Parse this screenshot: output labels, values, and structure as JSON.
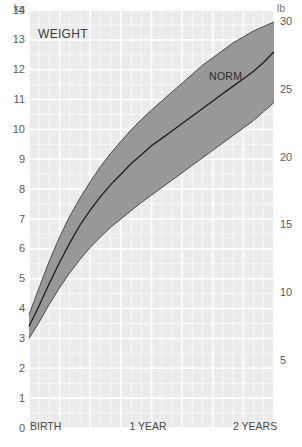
{
  "chart_title": "WEIGHT",
  "axes": {
    "left_unit": "kg",
    "right_unit": "lb",
    "left_ticks": [
      "0",
      "1",
      "2",
      "3",
      "4",
      "5",
      "6",
      "7",
      "8",
      "9",
      "10",
      "11",
      "12",
      "13",
      "14"
    ],
    "right_ticks": [
      "5",
      "10",
      "15",
      "20",
      "25",
      "30"
    ],
    "x_ticks": [
      "BIRTH",
      "1 YEAR",
      "2 YEARS"
    ]
  },
  "annotations": {
    "norm_label": "NORM"
  },
  "colors": {
    "plot_background": "#ebebeb",
    "gridline": "#ffffff",
    "band_fill": "#989898",
    "band_stroke": "#4a4a4a",
    "norm_line": "#1c1c1c",
    "tick_text": "#5a5a5a",
    "page_background": "#ffffff"
  },
  "chart_data": {
    "type": "area",
    "title": "WEIGHT",
    "xlabel": "",
    "ylabel": "kg",
    "xlim": [
      0,
      24
    ],
    "ylim": [
      0,
      14
    ],
    "y2lim": [
      0,
      30.86
    ],
    "y2label": "lb",
    "grid": true,
    "legend_position": "none",
    "x_unit": "months",
    "x_tick_positions": [
      0,
      12,
      24
    ],
    "x_tick_labels": [
      "BIRTH",
      "1 YEAR",
      "2 YEARS"
    ],
    "y_tick_values": [
      0,
      1,
      2,
      3,
      4,
      5,
      6,
      7,
      8,
      9,
      10,
      11,
      12,
      13,
      14
    ],
    "y2_tick_values": [
      5,
      10,
      15,
      20,
      25,
      30
    ],
    "x": [
      0,
      1,
      2,
      3,
      4,
      5,
      6,
      7,
      8,
      9,
      10,
      11,
      12,
      13,
      14,
      15,
      16,
      17,
      18,
      19,
      20,
      21,
      22,
      23,
      24
    ],
    "series": [
      {
        "name": "upper percentile",
        "values": [
          3.8,
          4.7,
          5.6,
          6.4,
          7.1,
          7.7,
          8.25,
          8.75,
          9.2,
          9.6,
          9.98,
          10.33,
          10.65,
          10.95,
          11.25,
          11.55,
          11.85,
          12.15,
          12.4,
          12.65,
          12.9,
          13.1,
          13.3,
          13.45,
          13.6
        ]
      },
      {
        "name": "NORM",
        "values": [
          3.4,
          4.1,
          4.85,
          5.55,
          6.2,
          6.8,
          7.3,
          7.75,
          8.15,
          8.5,
          8.85,
          9.15,
          9.45,
          9.7,
          9.95,
          10.2,
          10.45,
          10.7,
          10.95,
          11.2,
          11.45,
          11.7,
          11.95,
          12.25,
          12.6
        ]
      },
      {
        "name": "lower percentile",
        "values": [
          3.0,
          3.55,
          4.15,
          4.7,
          5.2,
          5.65,
          6.05,
          6.4,
          6.72,
          7.0,
          7.28,
          7.55,
          7.8,
          8.05,
          8.3,
          8.55,
          8.8,
          9.05,
          9.3,
          9.55,
          9.8,
          10.05,
          10.3,
          10.6,
          10.9
        ]
      }
    ]
  }
}
